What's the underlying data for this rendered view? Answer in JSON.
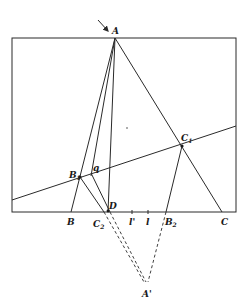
{
  "diagram": {
    "type": "geometric-construction",
    "frame": {
      "x1": 12,
      "y1": 38,
      "x2": 236,
      "y2": 212
    },
    "points": {
      "A": {
        "label": "A",
        "x": 115,
        "y": 38
      },
      "B": {
        "label": "B",
        "x": 71,
        "y": 212
      },
      "C": {
        "label": "C",
        "x": 222,
        "y": 212
      },
      "D": {
        "label": "D",
        "x": 108,
        "y": 212
      },
      "B1": {
        "label": "B",
        "sub": "1",
        "x": 80,
        "y": 177
      },
      "C1": {
        "label": "C",
        "sub": "1",
        "x": 182,
        "y": 146
      },
      "C2": {
        "label": "C",
        "sub": "2",
        "x": 104,
        "y": 212
      },
      "B2": {
        "label": "B",
        "sub": "2",
        "x": 166,
        "y": 212
      },
      "A_prime": {
        "label": "A'",
        "x": 146,
        "y": 285
      }
    },
    "labels": {
      "q": "q",
      "l": "l",
      "l_prime": "l'"
    },
    "transversal": {
      "x1": 12,
      "y1": 200,
      "x2": 236,
      "y2": 126
    },
    "arrow": {
      "from_x": 98,
      "from_y": 20,
      "to_x": 108,
      "to_y": 31
    }
  }
}
